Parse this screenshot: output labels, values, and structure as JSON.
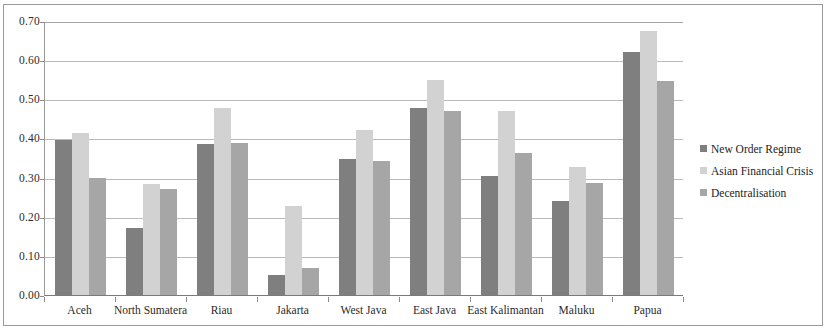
{
  "chart_data": {
    "type": "bar",
    "title": "",
    "subtitle": "",
    "xlabel": "",
    "ylabel": "",
    "ylim": [
      0.0,
      0.7
    ],
    "ytick_labels": [
      "0.70",
      "0.60",
      "0.50",
      "0.40",
      "0.30",
      "0.20",
      "0.10",
      "0.00"
    ],
    "ytick_values": [
      0.7,
      0.6,
      0.5,
      0.4,
      0.3,
      0.2,
      0.1,
      0.0
    ],
    "grid": true,
    "legend_position": "right",
    "categories": [
      "Aceh",
      "North Sumatera",
      "Riau",
      "Jakarta",
      "West Java",
      "East Java",
      "East Kalimantan",
      "Maluku",
      "Papua"
    ],
    "series": [
      {
        "name": "New Order Regime",
        "color": "#7f7f7f",
        "values": [
          0.395,
          0.172,
          0.385,
          0.05,
          0.348,
          0.478,
          0.305,
          0.24,
          0.622
        ]
      },
      {
        "name": "Asian Financial Crisis",
        "color": "#d2d2d2",
        "values": [
          0.415,
          0.283,
          0.478,
          0.228,
          0.422,
          0.55,
          0.47,
          0.327,
          0.675
        ]
      },
      {
        "name": "Decentralisation",
        "color": "#a6a6a6",
        "values": [
          0.298,
          0.27,
          0.388,
          0.07,
          0.343,
          0.47,
          0.363,
          0.287,
          0.548
        ]
      }
    ]
  },
  "legend": {
    "items": [
      {
        "label": "New Order Regime",
        "color": "#7f7f7f"
      },
      {
        "label": "Asian Financial Crisis",
        "color": "#d2d2d2"
      },
      {
        "label": "Decentralisation",
        "color": "#a6a6a6"
      }
    ]
  }
}
